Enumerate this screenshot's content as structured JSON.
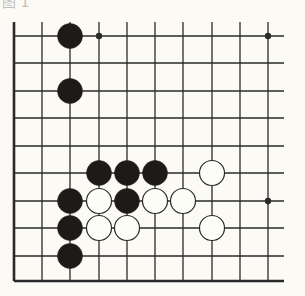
{
  "diagram": {
    "type": "go-board-fragment",
    "label_fragment": "图 1",
    "colors": {
      "background": "#fbfaf4",
      "line": "#2a2a2a",
      "black_stone": "#1e1a18",
      "white_stone_fill": "#fdfdf8",
      "white_stone_border": "#2a2a2a"
    },
    "grid": {
      "columns": 10,
      "rows": 10,
      "col_x": [
        14,
        42,
        70,
        99,
        127,
        155,
        183,
        212,
        240,
        268
      ],
      "row_y": [
        36,
        63,
        91,
        118,
        146,
        173,
        201,
        228,
        256,
        281
      ],
      "left_edge": true,
      "bottom_edge": true,
      "top_open": true,
      "right_open": true,
      "line_extend_right_x": 284,
      "line_extend_top_y": 22
    },
    "star_points": [
      {
        "col": 3,
        "row": 0
      },
      {
        "col": 9,
        "row": 0
      },
      {
        "col": 9,
        "row": 6
      }
    ],
    "stones": [
      {
        "color": "black",
        "col": 2,
        "row": 0
      },
      {
        "color": "black",
        "col": 2,
        "row": 2
      },
      {
        "color": "black",
        "col": 3,
        "row": 5
      },
      {
        "color": "black",
        "col": 4,
        "row": 5
      },
      {
        "color": "black",
        "col": 5,
        "row": 5
      },
      {
        "color": "white",
        "col": 7,
        "row": 5
      },
      {
        "color": "black",
        "col": 2,
        "row": 6
      },
      {
        "color": "white",
        "col": 3,
        "row": 6
      },
      {
        "color": "black",
        "col": 4,
        "row": 6
      },
      {
        "color": "white",
        "col": 5,
        "row": 6
      },
      {
        "color": "white",
        "col": 6,
        "row": 6
      },
      {
        "color": "black",
        "col": 2,
        "row": 7
      },
      {
        "color": "white",
        "col": 3,
        "row": 7
      },
      {
        "color": "white",
        "col": 4,
        "row": 7
      },
      {
        "color": "white",
        "col": 7,
        "row": 7
      },
      {
        "color": "black",
        "col": 2,
        "row": 8
      }
    ],
    "stone_radius": 12.5
  }
}
